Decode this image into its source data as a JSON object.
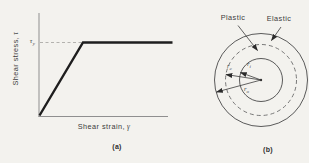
{
  "figure": {
    "background_color": "#f3f2ee",
    "curve_color": "#1e1e1e",
    "axis_color": "#8f8f8f",
    "panel_a": {
      "caption": "(a)",
      "y_axis_label": "Shear stress,",
      "y_axis_symbol": "τ",
      "x_axis_label": "Shear strain,",
      "x_axis_symbol": "γ",
      "yield_stress": {
        "base": "τ",
        "sub": "y"
      }
    },
    "panel_b": {
      "caption": "(b)",
      "regions": {
        "plastic": "Plastic",
        "elastic": "Elastic"
      },
      "radii": {
        "boundary": {
          "base": "r",
          "sub": "c"
        },
        "inner": {
          "base": "r",
          "sub": "i"
        },
        "outer": {
          "base": "r",
          "sub": "o"
        }
      }
    }
  }
}
